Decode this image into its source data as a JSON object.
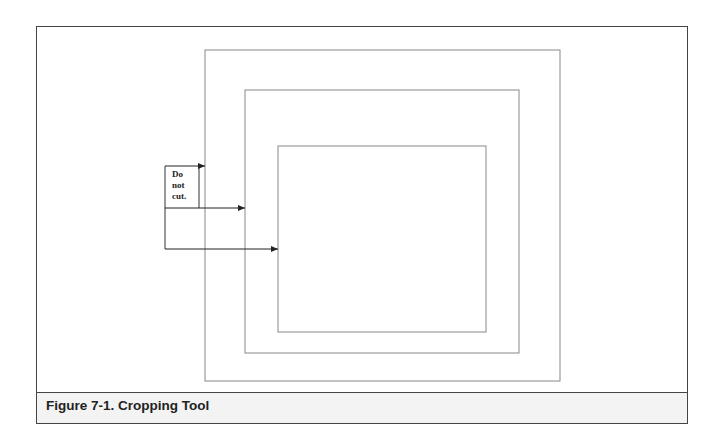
{
  "figure": {
    "caption": "Figure 7-1.  Cropping Tool",
    "note_lines": [
      "Do",
      "not",
      "cut."
    ],
    "colors": {
      "frame": "#444444",
      "lines": "#888888",
      "caption_bg": "#f3f3f3"
    }
  }
}
